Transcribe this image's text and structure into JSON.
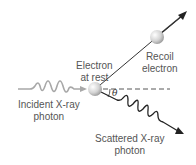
{
  "diagram": {
    "labels": {
      "electron_at_rest": [
        "Electron",
        "at rest"
      ],
      "recoil_electron": [
        "Recoil",
        "electron"
      ],
      "incident_photon": [
        "Incident X-ray",
        "photon"
      ],
      "scattered_photon": [
        "Scattered X-ray",
        "photon"
      ],
      "angle": "θ"
    },
    "colors": {
      "incident_wave": "#a8a8a8",
      "scattered_wave": "#222222",
      "recoil_line": "#333333",
      "electron_fill": "#d6d6d6",
      "dashed_line": "#444444",
      "text": "#555555"
    }
  }
}
